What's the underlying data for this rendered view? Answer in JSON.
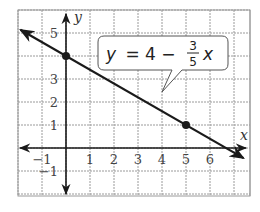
{
  "chart_data": {
    "type": "line",
    "title": "",
    "xlabel": "x",
    "ylabel": "y",
    "xlim": [
      -2,
      7.5
    ],
    "ylim": [
      -2,
      5.5
    ],
    "grid": true,
    "x_ticks": [
      "-1",
      "1",
      "2",
      "3",
      "4",
      "5",
      "6"
    ],
    "y_ticks": [
      "5",
      "3",
      "2",
      "1",
      "-1"
    ],
    "series": [
      {
        "name": "y = 4 - (3/5)x",
        "equation": "y = 4 - 3/5 x",
        "slope": -0.6,
        "intercept": 4,
        "points": [
          {
            "x": 0,
            "y": 4
          },
          {
            "x": 5,
            "y": 1
          }
        ]
      }
    ],
    "annotation": {
      "y_part": "y",
      "eq_mid": "= 4 −",
      "numerator": "3",
      "denominator": "5",
      "x_part": "x"
    }
  },
  "colors": {
    "line": "#1a1a1a",
    "grid": "#9a9a9a",
    "axis": "#1a1a1a"
  }
}
